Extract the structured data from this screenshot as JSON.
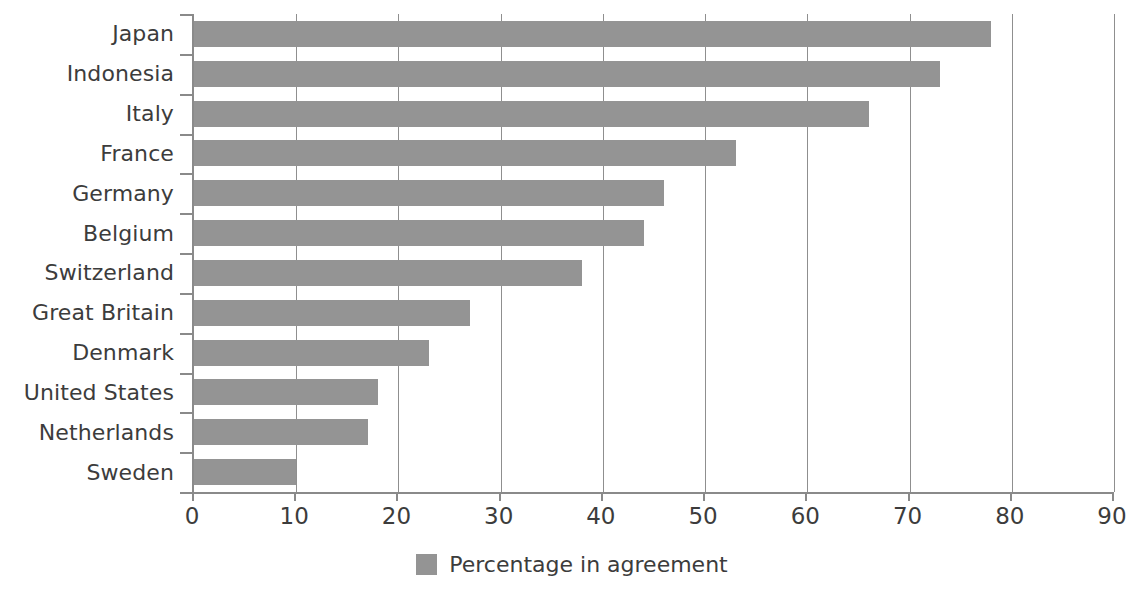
{
  "chart_data": {
    "type": "bar",
    "orientation": "horizontal",
    "title": "",
    "xlabel": "",
    "ylabel": "",
    "xlim": [
      0,
      90
    ],
    "xticks": [
      0,
      10,
      20,
      30,
      40,
      50,
      60,
      70,
      80,
      90
    ],
    "grid": "vertical",
    "legend": {
      "position": "bottom-center",
      "entries": [
        {
          "label": "Percentage in agreement",
          "color": "#949494"
        }
      ]
    },
    "categories": [
      "Japan",
      "Indonesia",
      "Italy",
      "France",
      "Germany",
      "Belgium",
      "Switzerland",
      "Great Britain",
      "Denmark",
      "United States",
      "Netherlands",
      "Sweden"
    ],
    "series": [
      {
        "name": "Percentage in agreement",
        "color": "#949494",
        "values": [
          78,
          73,
          66,
          53,
          46,
          44,
          38,
          27,
          23,
          18,
          17,
          10
        ]
      }
    ]
  },
  "style": {
    "bar_color": "#949494",
    "text_color": "#3c3c3c",
    "axis_color": "#8a8a8a",
    "gridline_color": "#8f8f8f",
    "background": "#ffffff"
  }
}
